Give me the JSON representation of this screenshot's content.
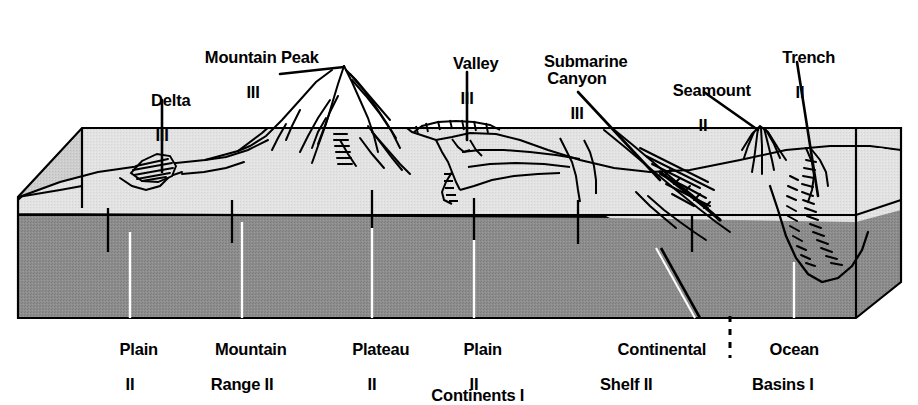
{
  "diagram": {
    "type": "geological-block-diagram",
    "colors": {
      "body_gray": "#8d8d8d",
      "surface_light": "#e3e3e3",
      "surface_mid": "#cfcfcf",
      "outline": "#000000",
      "background": "#ffffff"
    }
  },
  "top_labels": [
    {
      "name": "delta",
      "text": "Delta",
      "numeral": "III",
      "x": 162,
      "y": 74,
      "align": "c"
    },
    {
      "name": "mountain-peak",
      "text": "Mountain Peak",
      "numeral": "III",
      "x": 253,
      "y": 31,
      "align": "c"
    },
    {
      "name": "valley",
      "text": "Valley",
      "numeral": "III",
      "x": 467,
      "y": 37,
      "align": "c"
    },
    {
      "name": "submarine-canyon",
      "text": "Submarine\nCanyon",
      "numeral": "III",
      "x": 577,
      "y": 35,
      "align": "c"
    },
    {
      "name": "seamount",
      "text": "Seamount",
      "numeral": "II",
      "x": 703,
      "y": 64,
      "align": "c"
    },
    {
      "name": "trench",
      "text": "Trench",
      "numeral": "II",
      "x": 800,
      "y": 31,
      "align": "c"
    }
  ],
  "bottom_labels": [
    {
      "name": "plain-left",
      "line1": "Plain",
      "line2": "II",
      "x": 130,
      "y": 323
    },
    {
      "name": "mountain-range",
      "line1": "Mountain",
      "line2": "Range II",
      "x": 242,
      "y": 323
    },
    {
      "name": "plateau",
      "line1": "Plateau",
      "line2": "II",
      "x": 372,
      "y": 323
    },
    {
      "name": "plain-right",
      "line1": "Plain",
      "line2": "II",
      "x": 474,
      "y": 323
    },
    {
      "name": "continental-shelf",
      "line1": "Continental",
      "line2": "Shelf II",
      "x": 661,
      "y": 323
    },
    {
      "name": "ocean-basins",
      "line1": "Ocean",
      "line2": "Basins I",
      "x": 794,
      "y": 323
    }
  ],
  "footer_label": {
    "name": "continents",
    "text": "Continents I",
    "x": 469,
    "y": 369
  },
  "divider": {
    "name": "shelf-basin-divider",
    "x": 730,
    "y_top": 315,
    "y_bottom": 358,
    "style": "dashed"
  },
  "legend_note": {
    "tier_I": "I",
    "tier_II": "II",
    "tier_III": "III"
  }
}
